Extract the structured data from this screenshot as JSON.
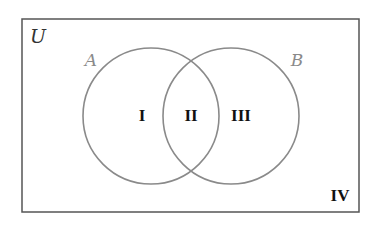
{
  "diagram": {
    "type": "venn",
    "universe": {
      "label": "U",
      "rect": {
        "x": 22,
        "y": 19,
        "width": 337,
        "height": 193
      }
    },
    "sets": [
      {
        "label": "A",
        "cx": 151,
        "cy": 116,
        "r": 68,
        "label_x": 91,
        "label_y": 66
      },
      {
        "label": "B",
        "cx": 231,
        "cy": 116,
        "r": 68,
        "label_x": 297,
        "label_y": 66
      }
    ],
    "regions": [
      {
        "label": "I",
        "x": 142,
        "y": 121,
        "description": "A only"
      },
      {
        "label": "II",
        "x": 191,
        "y": 121,
        "description": "A and B"
      },
      {
        "label": "III",
        "x": 241,
        "y": 121,
        "description": "B only"
      },
      {
        "label": "IV",
        "x": 340,
        "y": 201,
        "description": "neither A nor B"
      }
    ],
    "colors": {
      "universe_stroke": "#555555",
      "circle_stroke": "#8a8a8a",
      "set_label": "#8a8a8a",
      "universe_label": "#333333",
      "region_label": "#111111"
    }
  }
}
